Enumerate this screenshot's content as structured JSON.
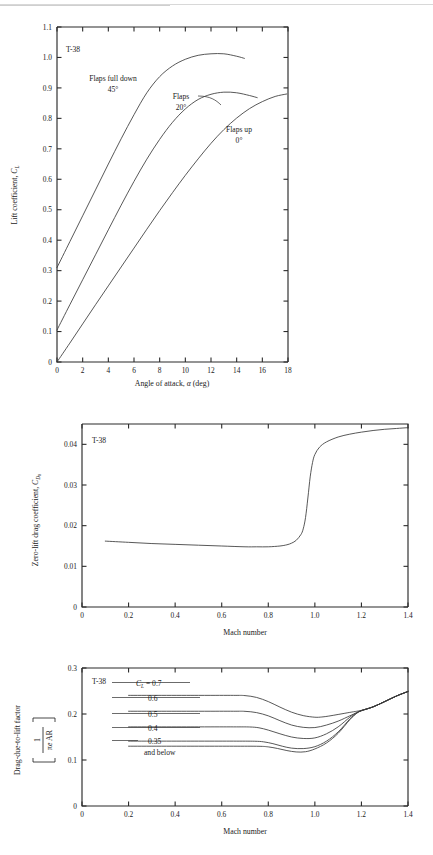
{
  "document": {
    "page_rule": true
  },
  "chart_data": [
    {
      "id": "lift-curve",
      "type": "line",
      "title": "T-38",
      "xlabel_parts": [
        "Angle of attack, ",
        "α",
        " (deg)"
      ],
      "xlabel": "Angle of attack, α (deg)",
      "ylabel_parts": [
        "Lift coefficient, ",
        "C",
        "L"
      ],
      "ylabel": "Lift coefficient, C_L",
      "xlim": [
        0,
        18
      ],
      "ylim": [
        0,
        1.1
      ],
      "xticks": [
        0,
        2,
        4,
        6,
        8,
        10,
        12,
        14,
        16,
        18
      ],
      "xticklabels": [
        "0",
        "2",
        "4",
        "6",
        "8",
        "10",
        "12",
        "14",
        "16",
        "18"
      ],
      "yticks": [
        0,
        0.1,
        0.2,
        0.3,
        0.4,
        0.5,
        0.6,
        0.7,
        0.8,
        0.9,
        1.0,
        1.1
      ],
      "yticklabels": [
        "0",
        "0.1",
        "0.2",
        "0.3",
        "0.4",
        "0.5",
        "0.6",
        "0.7",
        "0.8",
        "0.9",
        "1.0",
        "1.1"
      ],
      "grid": false,
      "legend_position": "inline-annotations",
      "series": [
        {
          "name": "Flaps full down 45°",
          "label_line1": "Flaps full down",
          "label_line2": "45°",
          "x": [
            0,
            1,
            2,
            3,
            4,
            5,
            6,
            7,
            8,
            9,
            10,
            11,
            12,
            13,
            14,
            14.6
          ],
          "y": [
            0.31,
            0.395,
            0.48,
            0.565,
            0.65,
            0.733,
            0.812,
            0.884,
            0.937,
            0.972,
            0.994,
            1.007,
            1.012,
            1.012,
            1.004,
            0.997
          ]
        },
        {
          "name": "Flaps 20°",
          "label_line1": "Flaps",
          "label_line2": "20°",
          "x": [
            0,
            1,
            2,
            3,
            4,
            5,
            6,
            7,
            8,
            9,
            10,
            11,
            12,
            13,
            14,
            15,
            15.6
          ],
          "y": [
            0.105,
            0.188,
            0.27,
            0.352,
            0.434,
            0.515,
            0.593,
            0.666,
            0.731,
            0.787,
            0.831,
            0.862,
            0.879,
            0.886,
            0.884,
            0.875,
            0.868
          ]
        },
        {
          "name": "Flaps up 0°",
          "label_line1": "Flaps up",
          "label_line2": "0°",
          "x": [
            0,
            1,
            2,
            3,
            4,
            5,
            6,
            7,
            8,
            9,
            10,
            11,
            12,
            13,
            14,
            15,
            16,
            17,
            17.9
          ],
          "y": [
            0.0,
            0.062,
            0.125,
            0.188,
            0.25,
            0.312,
            0.374,
            0.436,
            0.497,
            0.556,
            0.613,
            0.667,
            0.718,
            0.763,
            0.801,
            0.832,
            0.855,
            0.872,
            0.88
          ]
        }
      ]
    },
    {
      "id": "zero-lift-drag",
      "type": "line",
      "title": "T-38",
      "xlabel": "Mach number",
      "ylabel_parts": [
        "Zero-lift drag coefficient, ",
        "C",
        "D",
        "0"
      ],
      "ylabel": "Zero-lift drag coefficient, C_D0",
      "xlim": [
        0,
        1.4
      ],
      "ylim": [
        0,
        0.045
      ],
      "xticks": [
        0,
        0.2,
        0.4,
        0.6,
        0.8,
        1.0,
        1.2,
        1.4
      ],
      "xticklabels": [
        "0",
        "0.2",
        "0.4",
        "0.6",
        "0.8",
        "1.0",
        "1.2",
        "1.4"
      ],
      "yticks": [
        0,
        0.01,
        0.02,
        0.03,
        0.04
      ],
      "yticklabels": [
        "0",
        "0.01",
        "0.02",
        "0.03",
        "0.04"
      ],
      "grid": false,
      "series": [
        {
          "name": "CD0 vs Mach",
          "x": [
            0.1,
            0.2,
            0.3,
            0.4,
            0.5,
            0.6,
            0.7,
            0.75,
            0.8,
            0.85,
            0.88,
            0.9,
            0.92,
            0.94,
            0.95,
            0.96,
            0.97,
            0.98,
            0.99,
            1.0,
            1.02,
            1.05,
            1.1,
            1.15,
            1.2,
            1.25,
            1.3,
            1.35,
            1.4
          ],
          "y": [
            0.0162,
            0.0159,
            0.0156,
            0.0154,
            0.0152,
            0.015,
            0.0148,
            0.0148,
            0.0148,
            0.015,
            0.0153,
            0.0157,
            0.0164,
            0.0178,
            0.0192,
            0.022,
            0.0268,
            0.032,
            0.0355,
            0.0375,
            0.0393,
            0.0406,
            0.0418,
            0.0425,
            0.043,
            0.0434,
            0.0437,
            0.0439,
            0.0441
          ]
        }
      ]
    },
    {
      "id": "drag-due-to-lift",
      "type": "line",
      "title": "T-38",
      "xlabel": "Mach number",
      "ylabel_main": "Drag-due-to-lift factor",
      "ylabel_fraction_num": "1",
      "ylabel_fraction_den_parts": [
        "π",
        "e",
        " AR"
      ],
      "ylabel_fraction_den": "πe AR",
      "ylabel": "Drag-due-to-lift factor [1 / (πe AR)]",
      "xlim": [
        0,
        1.4
      ],
      "ylim": [
        0,
        0.3
      ],
      "xticks": [
        0,
        0.2,
        0.4,
        0.6,
        0.8,
        1.0,
        1.2,
        1.4
      ],
      "xticklabels": [
        "0",
        "0.2",
        "0.4",
        "0.6",
        "0.8",
        "1.0",
        "1.2",
        "1.4"
      ],
      "yticks": [
        0,
        0.1,
        0.2,
        0.3
      ],
      "yticklabels": [
        "0",
        "0.1",
        "0.2",
        "0.3"
      ],
      "grid": false,
      "legend_prefix_parts": [
        "C",
        "L",
        " = 0.7"
      ],
      "legend_prefix": "C_L = 0.7",
      "legend_labels": [
        "0.6",
        "0.5",
        "0.4",
        "0.35"
      ],
      "legend_note": "and below",
      "series": [
        {
          "name": "CL = 0.7",
          "x": [
            0.2,
            0.5,
            0.65,
            0.7,
            0.75,
            0.8,
            0.85,
            0.9,
            0.95,
            1.0,
            1.03,
            1.06,
            1.1,
            1.15,
            1.18,
            1.2,
            1.25,
            1.3,
            1.35,
            1.4
          ],
          "y": [
            0.2405,
            0.2405,
            0.2405,
            0.24,
            0.236,
            0.227,
            0.215,
            0.204,
            0.1965,
            0.193,
            0.1935,
            0.1955,
            0.199,
            0.2035,
            0.206,
            0.208,
            0.2155,
            0.227,
            0.239,
            0.249
          ]
        },
        {
          "name": "CL = 0.6",
          "x": [
            0.2,
            0.5,
            0.65,
            0.7,
            0.75,
            0.8,
            0.85,
            0.9,
            0.95,
            1.0,
            1.05,
            1.1,
            1.15,
            1.18,
            1.2,
            1.25,
            1.3,
            1.35,
            1.4
          ],
          "y": [
            0.206,
            0.206,
            0.206,
            0.2058,
            0.203,
            0.196,
            0.1855,
            0.176,
            0.171,
            0.1705,
            0.176,
            0.1845,
            0.196,
            0.203,
            0.2075,
            0.2155,
            0.227,
            0.239,
            0.249
          ]
        },
        {
          "name": "CL = 0.5",
          "x": [
            0.2,
            0.5,
            0.65,
            0.72,
            0.76,
            0.8,
            0.85,
            0.9,
            0.95,
            1.0,
            1.05,
            1.1,
            1.15,
            1.18,
            1.2,
            1.25,
            1.3,
            1.35,
            1.4
          ],
          "y": [
            0.172,
            0.172,
            0.172,
            0.1718,
            0.17,
            0.165,
            0.157,
            0.15,
            0.1468,
            0.148,
            0.157,
            0.172,
            0.193,
            0.203,
            0.2075,
            0.2155,
            0.227,
            0.239,
            0.249
          ]
        },
        {
          "name": "CL = 0.4",
          "x": [
            0.2,
            0.5,
            0.65,
            0.74,
            0.78,
            0.82,
            0.86,
            0.9,
            0.95,
            1.0,
            1.05,
            1.1,
            1.15,
            1.18,
            1.2,
            1.25,
            1.3,
            1.35,
            1.4
          ],
          "y": [
            0.141,
            0.141,
            0.141,
            0.1408,
            0.1395,
            0.1355,
            0.13,
            0.1258,
            0.1248,
            0.129,
            0.141,
            0.161,
            0.189,
            0.202,
            0.2072,
            0.2155,
            0.227,
            0.239,
            0.249
          ]
        },
        {
          "name": "CL = 0.35 and below",
          "x": [
            0.2,
            0.5,
            0.65,
            0.76,
            0.8,
            0.84,
            0.88,
            0.92,
            0.96,
            1.0,
            1.05,
            1.1,
            1.15,
            1.18,
            1.2,
            1.25,
            1.3,
            1.35,
            1.4
          ],
          "y": [
            0.13,
            0.13,
            0.13,
            0.1298,
            0.1285,
            0.125,
            0.1205,
            0.1175,
            0.118,
            0.124,
            0.137,
            0.158,
            0.1875,
            0.2015,
            0.207,
            0.2155,
            0.227,
            0.239,
            0.249
          ]
        }
      ]
    }
  ]
}
